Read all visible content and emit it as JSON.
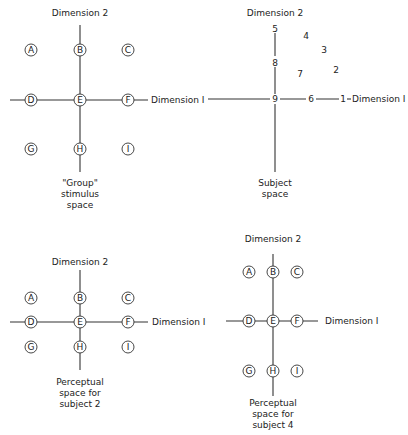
{
  "panels": [
    {
      "id": "group",
      "dim2_label": "Dimension 2",
      "dim1_label": "Dimension I",
      "caption": [
        "\"Group\"",
        "stimulus",
        "space"
      ],
      "points": [
        {
          "label": "A"
        },
        {
          "label": "B"
        },
        {
          "label": "C"
        },
        {
          "label": "D"
        },
        {
          "label": "E"
        },
        {
          "label": "F"
        },
        {
          "label": "G"
        },
        {
          "label": "H"
        },
        {
          "label": "I"
        }
      ]
    },
    {
      "id": "subject",
      "dim2_label": "Dimension 2",
      "dim1_label": "Dimension I",
      "caption": [
        "Subject",
        "space"
      ],
      "points": [
        {
          "label": "1"
        },
        {
          "label": "2"
        },
        {
          "label": "3"
        },
        {
          "label": "4"
        },
        {
          "label": "5"
        },
        {
          "label": "6"
        },
        {
          "label": "7"
        },
        {
          "label": "8"
        },
        {
          "label": "9"
        }
      ]
    },
    {
      "id": "subject2",
      "dim2_label": "Dimension 2",
      "dim1_label": "Dimension I",
      "caption": [
        "Perceptual",
        "space for",
        "subject 2"
      ],
      "points": [
        {
          "label": "A"
        },
        {
          "label": "B"
        },
        {
          "label": "C"
        },
        {
          "label": "D"
        },
        {
          "label": "E"
        },
        {
          "label": "F"
        },
        {
          "label": "G"
        },
        {
          "label": "H"
        },
        {
          "label": "I"
        }
      ]
    },
    {
      "id": "subject4",
      "dim2_label": "Dimension 2",
      "dim1_label": "Dimension I",
      "caption": [
        "Perceptual",
        "space for",
        "subject 4"
      ],
      "points": [
        {
          "label": "A"
        },
        {
          "label": "B"
        },
        {
          "label": "C"
        },
        {
          "label": "D"
        },
        {
          "label": "E"
        },
        {
          "label": "F"
        },
        {
          "label": "G"
        },
        {
          "label": "H"
        },
        {
          "label": "I"
        }
      ]
    }
  ]
}
